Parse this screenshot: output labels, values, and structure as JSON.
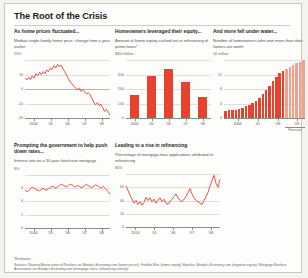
{
  "header": {
    "title": "The Root of the Crisis"
  },
  "panels": [
    {
      "kicker": "As home prices fluctuated...",
      "deck": "Median single-family home price, change from a year earlier"
    },
    {
      "kicker": "Homeowners leveraged their equity...",
      "deck": "Amount of home-equity cashed out in refinancing of prime loans*"
    },
    {
      "kicker": "And more fell under water...",
      "deck": "Number of homeowners who owe more than their homes are worth"
    },
    {
      "kicker": "Prompting the government to help push down rates...",
      "deck": "Interest rate on a 30-year fixed-rate mortgage"
    },
    {
      "kicker": "Leading to a rise in refinancing",
      "deck": "Percentage of mortgage-loan applications attributed to refinancing"
    }
  ],
  "footnotes": {
    "asterisk": "*Estimates",
    "sources": "Sources: National Association of Realtors via Moody's Economy.com (home prices); Freddie Mac (home equity); Equifax, Moody's Economy.com (negative equity); Mortgage Bankers Association via Moody's Economy.com (mortgage rates, refinancing activity)"
  },
  "colors": {
    "line": "#e8422e",
    "bar": "#e8422e",
    "bar_forecast": "#f0a08d",
    "grid": "#e0ded7",
    "axis": "#8d8b85"
  },
  "chart_data": [
    {
      "id": "home-prices",
      "type": "line",
      "title": "As home prices fluctuated...",
      "ylabel": "%",
      "xlabel": "",
      "ylim": [
        -20,
        20
      ],
      "yticks": [
        20,
        10,
        0,
        -10,
        -20
      ],
      "ytick_labels": [
        "20%",
        "10",
        "0",
        "-10",
        "-20"
      ],
      "xticks": [
        "2004",
        "'05",
        "'06",
        "'07",
        "'08"
      ],
      "grid": true,
      "values": [
        7.5,
        6.2,
        8.0,
        6.5,
        9.0,
        7.5,
        10.5,
        9.0,
        11.5,
        10.0,
        12.0,
        10.5,
        13.0,
        12.0,
        14.5,
        13.5,
        16.0,
        14.5,
        17.0,
        15.5,
        16.5,
        14.0,
        12.0,
        9.5,
        7.0,
        5.0,
        3.5,
        2.0,
        0.5,
        -0.5,
        0.5,
        -1.5,
        -0.5,
        -2.0,
        -3.5,
        -2.5,
        -4.0,
        -6.5,
        -9.0,
        -11.0,
        -9.5,
        -11.5,
        -10.5,
        -13.0,
        -15.5,
        -14.0,
        -16.0,
        -18.0
      ]
    },
    {
      "id": "home-equity-cashed-out",
      "type": "bar",
      "title": "Homeowners leveraged their equity...",
      "ylabel": "$ billion",
      "ylim": [
        0,
        400
      ],
      "yticks": [
        400,
        300,
        200,
        100,
        0
      ],
      "ytick_labels": [
        "$400 billion",
        "300",
        "200",
        "100",
        "0"
      ],
      "categories": [
        "2004",
        "'05",
        "'06",
        "'07",
        "'08"
      ],
      "values": [
        160,
        290,
        340,
        250,
        145
      ],
      "grid": true
    },
    {
      "id": "underwater-homeowners",
      "type": "bar",
      "title": "And more fell under water...",
      "ylabel": "million",
      "ylim": [
        0,
        16
      ],
      "yticks": [
        16,
        12,
        8,
        4,
        0
      ],
      "ytick_labels": [
        "16 million",
        "12",
        "8",
        "4",
        "0"
      ],
      "categories": [
        "2006",
        "'07",
        "'08",
        "'09"
      ],
      "xtick_positions": [
        3.5,
        9.5,
        15.5,
        21.0
      ],
      "values": [
        2.0,
        2.1,
        2.2,
        2.3,
        2.5,
        2.8,
        3.2,
        3.6,
        4.2,
        4.8,
        5.6,
        6.5,
        7.6,
        8.8,
        10.2,
        11.4,
        12.3,
        13.0,
        13.6,
        14.2,
        14.7,
        15.1,
        15.5,
        15.9
      ],
      "forecast_from_index": 18,
      "forecast_label": "Forecast",
      "grid": true
    },
    {
      "id": "mortgage-rate",
      "type": "line",
      "title": "Prompting the government to help push down rates...",
      "ylabel": "%",
      "ylim": [
        0,
        8
      ],
      "yticks": [
        8,
        6,
        4,
        2,
        0
      ],
      "ytick_labels": [
        "8%",
        "6",
        "4",
        "2",
        "0"
      ],
      "xticks": [
        "2004",
        "'05",
        "'06",
        "'07",
        "'08"
      ],
      "grid": true,
      "values": [
        5.7,
        5.5,
        5.6,
        5.9,
        6.2,
        6.0,
        5.8,
        5.7,
        5.6,
        5.8,
        6.0,
        5.8,
        5.7,
        5.9,
        6.1,
        6.3,
        6.2,
        6.0,
        6.2,
        6.4,
        6.6,
        6.5,
        6.3,
        6.2,
        6.4,
        6.6,
        6.5,
        6.3,
        6.2,
        6.4,
        6.3,
        6.1,
        6.2,
        6.4,
        6.6,
        6.4,
        6.2,
        6.1,
        6.3,
        6.5,
        6.4,
        6.2,
        6.0,
        6.3,
        6.1,
        5.8,
        5.5,
        5.1
      ]
    },
    {
      "id": "refinancing-share",
      "type": "line",
      "title": "Leading to a rise in refinancing",
      "ylabel": "%",
      "ylim": [
        0,
        80
      ],
      "yticks": [
        80,
        60,
        40,
        20,
        0
      ],
      "ytick_labels": [
        "80%",
        "60",
        "40",
        "20",
        "0"
      ],
      "xticks": [
        "2004",
        "'05",
        "'06",
        "'07",
        "'08"
      ],
      "grid": true,
      "values": [
        62,
        55,
        48,
        42,
        36,
        40,
        34,
        38,
        33,
        37,
        45,
        40,
        44,
        38,
        42,
        36,
        40,
        44,
        38,
        42,
        36,
        34,
        38,
        42,
        46,
        50,
        44,
        40,
        38,
        42,
        46,
        52,
        58,
        50,
        44,
        40,
        38,
        36,
        34,
        40,
        46,
        52,
        62,
        70,
        78,
        66,
        60,
        72
      ]
    }
  ]
}
